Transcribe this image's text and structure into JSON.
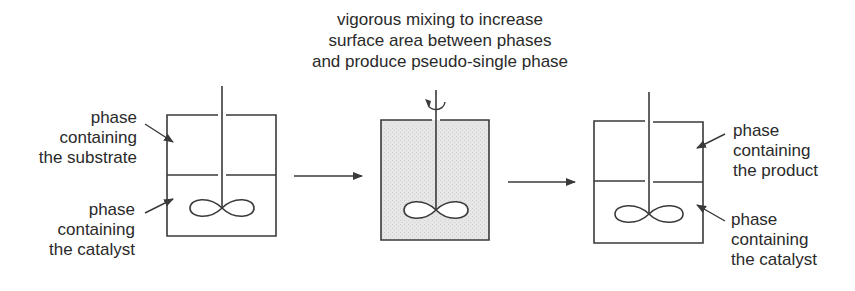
{
  "title_annotation": {
    "lines": [
      "vigorous mixing to increase",
      "surface area between phases",
      "and produce pseudo-single phase"
    ]
  },
  "vessels": [
    {
      "name": "biphasic-before",
      "fill": "#ffffff",
      "labels": [
        {
          "lines": [
            "phase",
            "containing",
            "the substrate"
          ]
        },
        {
          "lines": [
            "phase",
            "containing",
            "the catalyst"
          ]
        }
      ]
    },
    {
      "name": "mixing",
      "fill": "#e3e3e3",
      "labels": []
    },
    {
      "name": "biphasic-after",
      "fill": "#ffffff",
      "labels": [
        {
          "lines": [
            "phase",
            "containing",
            "the product"
          ]
        },
        {
          "lines": [
            "phase",
            "containing",
            "the catalyst"
          ]
        }
      ]
    }
  ],
  "colors": {
    "stroke": "#3a3a3a",
    "text": "#2a2a2a",
    "mixed_fill": "#e3e3e3"
  },
  "icons": {
    "process_arrow": "right-arrow-icon",
    "rotation": "rotation-arrow-icon",
    "impeller": "impeller-icon"
  }
}
